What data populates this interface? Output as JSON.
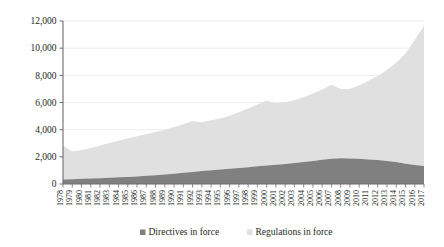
{
  "chart_data": {
    "type": "area",
    "stacked": true,
    "title": "",
    "subtitle": "",
    "xlabel": "",
    "ylabel": "",
    "ylim": [
      0,
      12000
    ],
    "yticks": [
      0,
      2000,
      4000,
      6000,
      8000,
      10000,
      12000
    ],
    "ytick_labels": [
      "0",
      "2,000",
      "4,000",
      "6,000",
      "8,000",
      "10,000",
      "12,000"
    ],
    "grid": true,
    "grid_axis": "y",
    "legend_position": "bottom",
    "categories": [
      "1978",
      "1979",
      "1980",
      "1981",
      "1982",
      "1983",
      "1984",
      "1985",
      "1986",
      "1987",
      "1988",
      "1989",
      "1990",
      "1991",
      "1992",
      "1993",
      "1994",
      "1995",
      "1996",
      "1997",
      "1998",
      "1999",
      "2000",
      "2001",
      "2002",
      "2003",
      "2004",
      "2005",
      "2006",
      "2007",
      "2008",
      "2009",
      "2010",
      "2011",
      "2012",
      "2013",
      "2014",
      "2015",
      "2016",
      "2017"
    ],
    "series": [
      {
        "name": "Directives in force",
        "color": "#808080",
        "values": [
          330,
          350,
          380,
          400,
          430,
          460,
          490,
          520,
          560,
          600,
          650,
          700,
          760,
          820,
          880,
          950,
          1010,
          1070,
          1120,
          1180,
          1240,
          1300,
          1360,
          1420,
          1480,
          1550,
          1620,
          1700,
          1780,
          1860,
          1900,
          1880,
          1850,
          1800,
          1760,
          1700,
          1620,
          1500,
          1400,
          1330
        ]
      },
      {
        "name": "Regulations in force",
        "color": "#e0e0e0",
        "values": [
          2500,
          2050,
          2120,
          2250,
          2400,
          2550,
          2700,
          2850,
          2960,
          3060,
          3180,
          3300,
          3440,
          3580,
          3760,
          3600,
          3680,
          3760,
          3900,
          4100,
          4320,
          4560,
          4780,
          4520,
          4540,
          4620,
          4780,
          4960,
          5180,
          5440,
          5100,
          5120,
          5420,
          5800,
          6200,
          6700,
          7300,
          8100,
          9200,
          10300
        ]
      }
    ],
    "totals": [
      2830,
      2400,
      2500,
      2650,
      2830,
      3010,
      3190,
      3370,
      3520,
      3660,
      3830,
      4000,
      4200,
      4400,
      4640,
      4550,
      4690,
      4830,
      5020,
      5280,
      5560,
      5860,
      6140,
      5940,
      6020,
      6170,
      6400,
      6660,
      6960,
      7300,
      7000,
      7000,
      7270,
      7600,
      7960,
      8400,
      8920,
      9600,
      10600,
      11630
    ]
  },
  "legend": {
    "items": [
      {
        "label": "Directives in force",
        "color": "#808080"
      },
      {
        "label": "Regulations in force",
        "color": "#e0e0e0"
      }
    ]
  }
}
